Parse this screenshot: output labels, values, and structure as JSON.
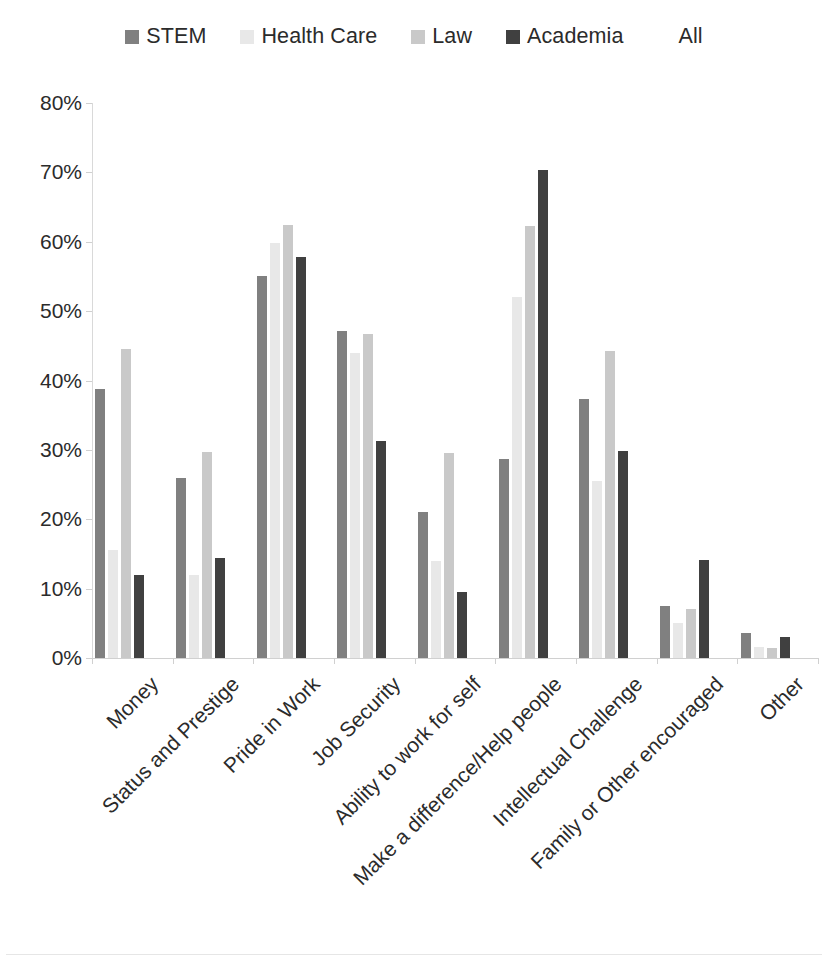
{
  "chart_data": {
    "type": "bar",
    "title": "",
    "subtitle": "",
    "xlabel": "",
    "ylabel": "",
    "ylim": [
      0,
      80
    ],
    "ytick_labels": [
      "0%",
      "10%",
      "20%",
      "30%",
      "40%",
      "50%",
      "60%",
      "70%",
      "80%"
    ],
    "ytick_values": [
      0,
      10,
      20,
      30,
      40,
      50,
      60,
      70,
      80
    ],
    "grid": false,
    "legend_position": "top-center",
    "value_unit": "%",
    "categories": [
      "Money",
      "Status and Prestige",
      "Pride in Work",
      "Job Security",
      "Ability to work for self",
      "Make a difference/Help people",
      "Intellectual Challenge",
      "Family or Other encouraged",
      "Other"
    ],
    "series": [
      {
        "name": "STEM",
        "color": "#808080",
        "values": [
          38.8,
          26.0,
          55.0,
          47.2,
          21.0,
          28.7,
          37.3,
          7.5,
          3.6
        ]
      },
      {
        "name": "Health Care",
        "color": "#e8e8e8",
        "values": [
          15.5,
          12.0,
          59.8,
          44.0,
          14.0,
          52.0,
          25.5,
          5.0,
          1.6
        ]
      },
      {
        "name": "Law",
        "color": "#c9c9c9",
        "values": [
          44.5,
          29.7,
          62.4,
          46.7,
          29.5,
          62.3,
          44.3,
          7.0,
          1.5
        ]
      },
      {
        "name": "Academia",
        "color": "#404040",
        "values": [
          11.9,
          14.4,
          57.8,
          31.3,
          9.5,
          70.3,
          29.8,
          14.2,
          3.1
        ]
      },
      {
        "name": "All",
        "color": "#ffffff",
        "values": [
          0,
          0,
          0,
          0,
          0,
          0,
          0,
          0,
          0
        ]
      }
    ]
  },
  "legend": {
    "items": [
      {
        "label": "STEM",
        "color": "#808080"
      },
      {
        "label": "Health Care",
        "color": "#e8e8e8"
      },
      {
        "label": "Law",
        "color": "#c9c9c9"
      },
      {
        "label": "Academia",
        "color": "#404040"
      },
      {
        "label": "All",
        "color": "#ffffff"
      }
    ]
  },
  "axes": {
    "y": {
      "ticks": [
        "0%",
        "10%",
        "20%",
        "30%",
        "40%",
        "50%",
        "60%",
        "70%",
        "80%"
      ]
    },
    "x": {
      "ticks": [
        "Money",
        "Status and Prestige",
        "Pride in Work",
        "Job Security",
        "Ability to work for self",
        "Make a difference/Help people",
        "Intellectual Challenge",
        "Family or Other encouraged",
        "Other"
      ]
    }
  }
}
